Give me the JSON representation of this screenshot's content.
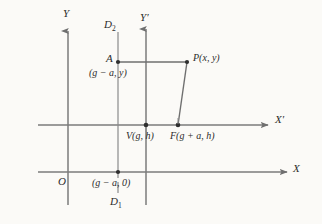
{
  "figure": {
    "background_color": "#fbfaf7",
    "line_color": "#7b7b7b",
    "text_color": "#2b2b2b"
  },
  "axes": {
    "y_label": "Y",
    "x_label": "X",
    "y_prime_label": "Y",
    "y_prime_mark": "′",
    "x_prime_label": "X",
    "x_prime_mark": "′",
    "origin_label": "O"
  },
  "directrix": {
    "top_label": "D",
    "top_sub": "2",
    "bottom_label": "D",
    "bottom_sub": "1"
  },
  "points": {
    "a_name": "A",
    "a_coords": "(g − a, y)",
    "p_label": "P(x, y)",
    "v_label": "V(g, h)",
    "f_label": "F(g + a, h)",
    "foot_coords": "(g − a, 0)"
  },
  "geometry": {
    "y_axis_x": 68,
    "x_axis_y": 172,
    "y_prime_x": 146,
    "x_prime_y": 125,
    "directrix_x": 118,
    "a_y": 62,
    "p_x": 187,
    "f_x": 178
  }
}
